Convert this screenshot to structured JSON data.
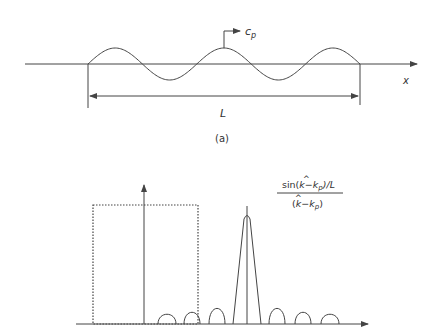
{
  "figure_a": {
    "wave_speed_label": "c",
    "wave_speed_subscript": "p",
    "axis_label": "x",
    "length_label": "L",
    "caption": "(a)",
    "wave_cycles": 2.5
  },
  "figure_b": {
    "formula_numerator_prefix": "sin(",
    "formula_numerator_khat": "k",
    "formula_numerator_mid": "−k",
    "formula_numerator_sub": "p",
    "formula_numerator_suffix": ")/L",
    "formula_denominator_prefix": "(",
    "formula_denominator_khat": "k",
    "formula_denominator_mid": "−k",
    "formula_denominator_sub": "p",
    "formula_denominator_suffix": ")",
    "side_lobes_left": 3,
    "side_lobes_right": 3
  },
  "colors": {
    "line": "#444444",
    "background": "#ffffff"
  }
}
